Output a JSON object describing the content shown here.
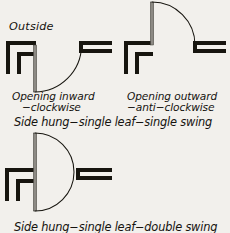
{
  "sheet": {
    "background_color": "#f2f0ec",
    "ink_color": "#17150f",
    "leaf_color": "#8d8a84"
  },
  "labels": {
    "outside": "Outside",
    "left_caption_line1": "Opening inward",
    "left_caption_line2": "−clockwise",
    "right_caption_line1": "Opening outward",
    "right_caption_line2": "−anti−clockwise",
    "group_caption_top": "Side hung−single leaf−single swing",
    "group_caption_bottom": "Side hung−single leaf−double swing"
  },
  "diagrams": [
    {
      "name": "opening-inward-clockwise",
      "swing": "inward",
      "rotation": "clockwise",
      "leaf_direction": "down",
      "hinge": {
        "x": 35,
        "y": 45
      },
      "leaf_length": 47,
      "arc_start": {
        "x": 35,
        "y": 92
      },
      "arc_end": {
        "x": 81,
        "y": 46
      }
    },
    {
      "name": "opening-outward-anti-clockwise",
      "swing": "outward",
      "rotation": "anti-clockwise",
      "leaf_direction": "up",
      "hinge": {
        "x": 152,
        "y": 45
      },
      "leaf_length": 43,
      "arc_start": {
        "x": 152,
        "y": 2
      },
      "arc_end": {
        "x": 195,
        "y": 45
      }
    },
    {
      "name": "side-hung-double-swing",
      "swing": "both",
      "rotation": "double",
      "leaf_direction": "up-and-down",
      "hinge": {
        "x": 35,
        "y": 172
      },
      "leaf_length": 39,
      "arc_start": {
        "x": 35,
        "y": 133
      },
      "arc_end": {
        "x": 35,
        "y": 211
      }
    }
  ]
}
